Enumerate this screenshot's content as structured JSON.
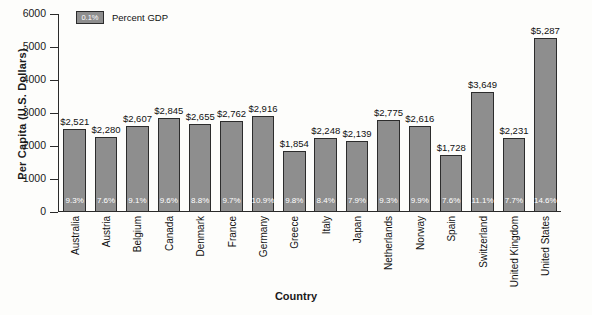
{
  "chart_data": {
    "type": "bar",
    "title": "",
    "xlabel": "Country",
    "ylabel": "Per Capita (U.S. Dollars)",
    "ylim": [
      0,
      6000
    ],
    "yticks": [
      "0",
      "1000",
      "2000",
      "3000",
      "4000",
      "5000",
      "6000"
    ],
    "ytick_values": [
      0,
      1000,
      2000,
      3000,
      4000,
      5000,
      6000
    ],
    "grid": false,
    "legend_position": "top-left",
    "legend": [
      {
        "label": "Percent GDP",
        "swatch_text": "0.1%",
        "color": "#8e8e8e"
      }
    ],
    "categories": [
      "Australia",
      "Austria",
      "Belgium",
      "Canada",
      "Denmark",
      "France",
      "Germany",
      "Greece",
      "Italy",
      "Japan",
      "Netherlands",
      "Norway",
      "Spain",
      "Switzerland",
      "United Kingdom",
      "United States"
    ],
    "values": [
      2521,
      2280,
      2607,
      2845,
      2655,
      2762,
      2916,
      1854,
      2248,
      2139,
      2775,
      2616,
      1728,
      3649,
      2231,
      5287
    ],
    "value_labels": [
      "$2,521",
      "$2,280",
      "$2,607",
      "$2,845",
      "$2,655",
      "$2,762",
      "$2,916",
      "$1,854",
      "$2,248",
      "$2,139",
      "$2,775",
      "$2,616",
      "$1,728",
      "$3,649",
      "$2,231",
      "$5,287"
    ],
    "percent_gdp_labels": [
      "9.3%",
      "7.6%",
      "9.1%",
      "9.6%",
      "8.8%",
      "9.7%",
      "10.9%",
      "9.8%",
      "8.4%",
      "7.9%",
      "9.3%",
      "9.9%",
      "7.6%",
      "11.1%",
      "7.7%",
      "14.6%"
    ],
    "percent_gdp_values": [
      9.3,
      7.6,
      9.1,
      9.6,
      8.8,
      9.7,
      10.9,
      9.8,
      8.4,
      7.9,
      9.3,
      9.9,
      7.6,
      11.1,
      7.7,
      14.6
    ],
    "colors": {
      "bar_fill": "#8e8e8e",
      "bar_edge": "#2c2c2c",
      "axis": "#2a2a2a",
      "text": "#111111",
      "pct_text": "#ffffff"
    }
  }
}
